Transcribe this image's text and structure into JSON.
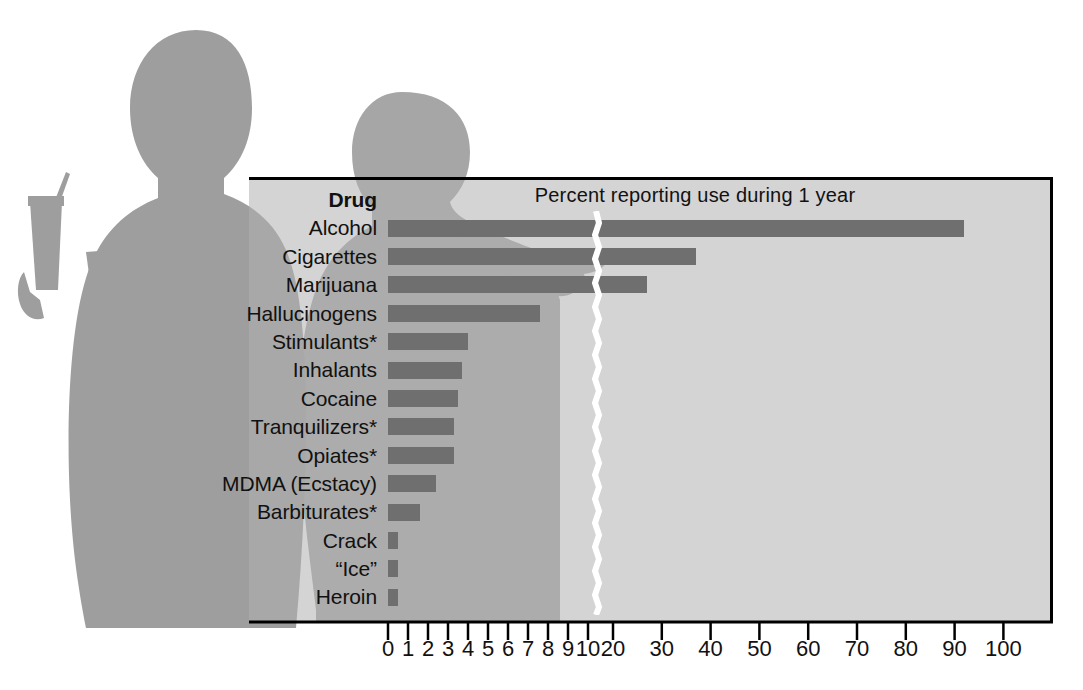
{
  "header": {
    "title": "Percent reporting use during 1 year"
  },
  "table": {
    "column_header": "Drug"
  },
  "footnote_marker": "*",
  "colors": {
    "bar": "#6f6f6f",
    "panel_background": "#b0b0b0",
    "silhouette": "#a0a0a0",
    "frame": "#000000",
    "text": "#111111",
    "axis_break": "#ffffff"
  },
  "chart_data": {
    "type": "bar",
    "title": "Percent reporting use during 1 year",
    "xlabel": "",
    "ylabel": "Drug",
    "orientation": "horizontal",
    "grid": false,
    "legend": null,
    "axis_break": {
      "after": 10,
      "before": 20,
      "note": "broken x-axis: fine scale 0-10, coarse scale 20-100"
    },
    "xlim": [
      0,
      100
    ],
    "xticks_fine": [
      0,
      1,
      2,
      3,
      4,
      5,
      6,
      7,
      8,
      9,
      10
    ],
    "xticks_coarse": [
      20,
      30,
      40,
      50,
      60,
      70,
      80,
      90,
      100
    ],
    "xticklabels": [
      "0",
      "1",
      "2",
      "3",
      "4",
      "5",
      "6",
      "7",
      "8",
      "9",
      "10",
      "20",
      "30",
      "40",
      "50",
      "60",
      "70",
      "80",
      "90",
      "100"
    ],
    "categories": [
      "Alcohol",
      "Cigarettes",
      "Marijuana",
      "Hallucinogens",
      "Stimulants*",
      "Inhalants",
      "Cocaine",
      "Tranquilizers*",
      "Opiates*",
      "MDMA (Ecstacy)",
      "Barbiturates*",
      "Crack",
      "“Ice”",
      "Heroin"
    ],
    "values": [
      92,
      37,
      27,
      7.6,
      4.0,
      3.7,
      3.5,
      3.3,
      3.3,
      2.4,
      1.6,
      0.5,
      0.5,
      0.5
    ]
  }
}
